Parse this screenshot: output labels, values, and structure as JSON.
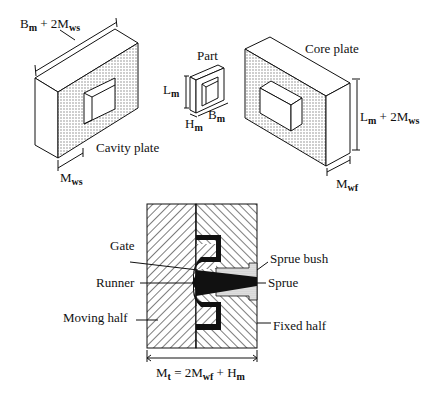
{
  "figure": {
    "cavity_plate": {
      "label": "Cavity plate",
      "width_dim": {
        "main": "B",
        "sub1": "m",
        "mid": " + 2M",
        "sub2": "ws"
      },
      "depth_dim": {
        "main": "M",
        "sub": "ws"
      }
    },
    "part": {
      "label": "Part",
      "length_dim": {
        "main": "L",
        "sub": "m"
      },
      "height_dim": {
        "main": "H",
        "sub": "m"
      },
      "breadth_dim": {
        "main": "B",
        "sub": "m"
      }
    },
    "core_plate": {
      "label": "Core plate",
      "length_dim": {
        "main": "L",
        "sub1": "m",
        "mid": " + 2M",
        "sub2": "ws"
      },
      "depth_dim": {
        "main": "M",
        "sub": "wf"
      }
    },
    "mold_section": {
      "labels_left": [
        "Gate",
        "Runner",
        "Moving half"
      ],
      "labels_right": [
        "Sprue bush",
        "Sprue",
        "Fixed half"
      ],
      "total_dim": {
        "main": "M",
        "sub1": "t",
        "mid": " = 2M",
        "sub2": "wf",
        "mid2": " + H",
        "sub3": "m"
      }
    }
  },
  "colors": {
    "line": "#111111",
    "stipple": "#9a9a9a",
    "background": "#ffffff"
  }
}
